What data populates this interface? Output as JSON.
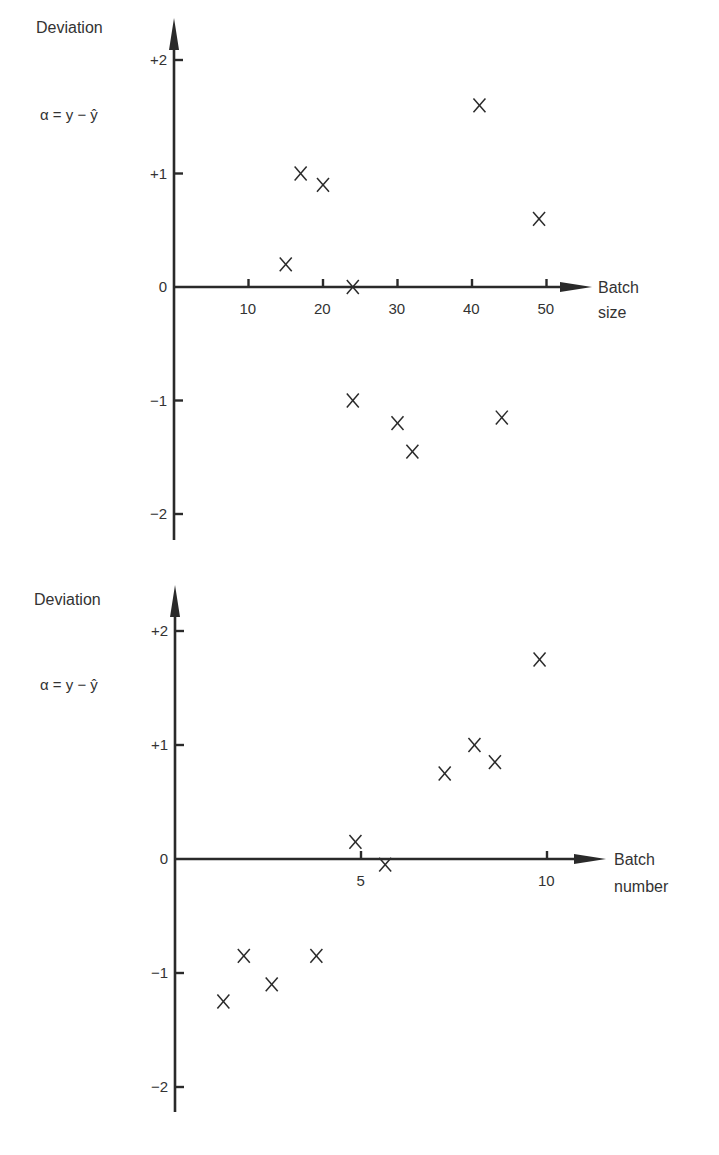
{
  "chart_data": [
    {
      "type": "scatter",
      "title": "",
      "ylabel": "Deviation",
      "ylabel_formula": "α = y − ŷ",
      "xlabel_line1": "Batch",
      "xlabel_line2": "size",
      "xlabel": "Batch size",
      "xlim": [
        0,
        55
      ],
      "ylim": [
        -2.2,
        2.5
      ],
      "xticks": [
        10,
        20,
        30,
        40,
        50
      ],
      "xtick_labels": [
        "10",
        "20",
        "30",
        "40",
        "50"
      ],
      "yticks": [
        2,
        1,
        0,
        -1,
        -2
      ],
      "ytick_labels": [
        "+2",
        "+1",
        "0",
        "−1",
        "−2"
      ],
      "grid": false,
      "marker": "x",
      "points": [
        {
          "x": 15,
          "y": 0.2
        },
        {
          "x": 17,
          "y": 1.0
        },
        {
          "x": 20,
          "y": 0.9
        },
        {
          "x": 24,
          "y": 0.0
        },
        {
          "x": 24,
          "y": -1.0
        },
        {
          "x": 30,
          "y": -1.2
        },
        {
          "x": 32,
          "y": -1.45
        },
        {
          "x": 41,
          "y": 1.6
        },
        {
          "x": 44,
          "y": -1.15
        },
        {
          "x": 49,
          "y": 0.6
        }
      ]
    },
    {
      "type": "scatter",
      "title": "",
      "ylabel": "Deviation",
      "ylabel_formula": "α = y − ŷ",
      "xlabel_line1": "Batch",
      "xlabel_line2": "number",
      "xlabel": "Batch number",
      "xlim": [
        0,
        11
      ],
      "ylim": [
        -2.2,
        2.5
      ],
      "xticks": [
        5,
        10
      ],
      "xtick_labels": [
        "5",
        "10"
      ],
      "yticks": [
        2,
        1,
        0,
        -1,
        -2
      ],
      "ytick_labels": [
        "+2",
        "+1",
        "0",
        "−1",
        "−2"
      ],
      "grid": false,
      "marker": "x",
      "points": [
        {
          "x": 1.3,
          "y": -1.25
        },
        {
          "x": 1.85,
          "y": -0.85
        },
        {
          "x": 2.6,
          "y": -1.1
        },
        {
          "x": 3.8,
          "y": -0.85
        },
        {
          "x": 4.85,
          "y": 0.15
        },
        {
          "x": 5.65,
          "y": -0.05
        },
        {
          "x": 7.25,
          "y": 0.75
        },
        {
          "x": 8.05,
          "y": 1.0
        },
        {
          "x": 8.6,
          "y": 0.85
        },
        {
          "x": 9.8,
          "y": 1.75
        }
      ]
    }
  ],
  "colors": {
    "ink": "#2a2a2a",
    "background": "#ffffff"
  }
}
